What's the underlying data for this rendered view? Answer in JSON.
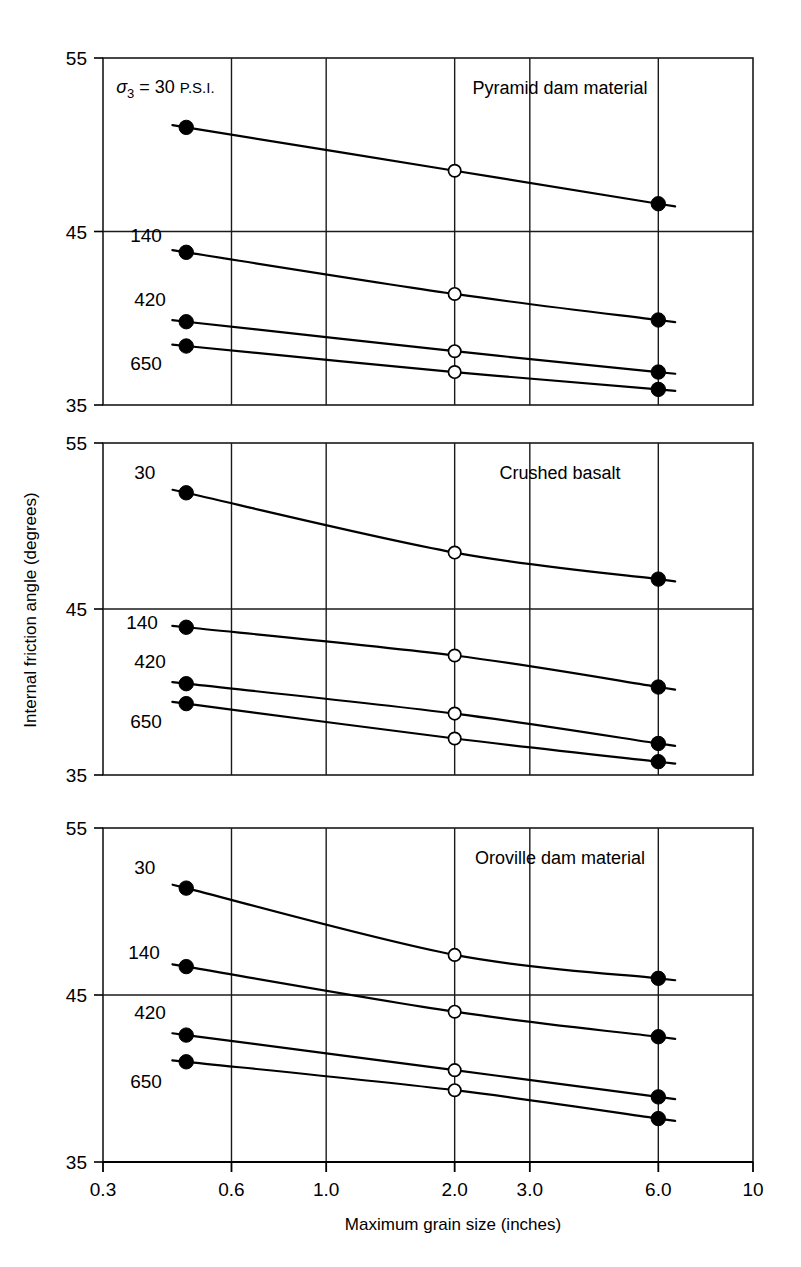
{
  "figure": {
    "width": 801,
    "height": 1267,
    "background": "#ffffff",
    "line_color": "#000000",
    "grid_color": "#1a1a1a"
  },
  "axes": {
    "x": {
      "label": "Maximum grain size (inches)",
      "scale": "log",
      "min": 0.3,
      "max": 10,
      "ticks": [
        0.3,
        0.6,
        1.0,
        2.0,
        3.0,
        6.0,
        10
      ],
      "tick_labels": [
        "0.3",
        "0.6",
        "1.0",
        "2.0",
        "3.0",
        "6.0",
        "10"
      ],
      "gridlines": [
        0.6,
        1.0,
        2.0,
        3.0,
        6.0
      ]
    },
    "y": {
      "label": "Internal friction angle (degrees)",
      "scale": "linear",
      "min": 35,
      "max": 55,
      "ticks": [
        35,
        45,
        55
      ],
      "tick_labels": [
        "35",
        "45",
        "55"
      ],
      "gridlines": [
        45
      ]
    }
  },
  "legend_note": {
    "symbol": "σ",
    "subscript": "3",
    "equals": " = ",
    "value": "30",
    "unit": "P.S.I.",
    "full_text": "σ3 = 30 P.S.I."
  },
  "markers": {
    "filled_circle": "filled-circle-marker",
    "open_circle": "open-circle-marker"
  },
  "chart_data": {
    "type": "line",
    "xlabel": "Maximum grain size (inches)",
    "ylabel": "Internal friction angle (degrees)",
    "xscale": "log",
    "xlim": [
      0.3,
      10
    ],
    "ylim": [
      35,
      55
    ],
    "grid": true,
    "legend_position": "inline-curve-labels",
    "panels": [
      {
        "id": "pyramid-dam-material",
        "title": "Pyramid dam material",
        "series": [
          {
            "name": "30",
            "confining_pressure_psi": 30,
            "label_text": "σ3 = 30 P.S.I.",
            "x": [
              0.47,
              2.0,
              6.0
            ],
            "y": [
              51.0,
              48.5,
              46.6
            ],
            "marker_types": [
              "filled",
              "open",
              "filled"
            ]
          },
          {
            "name": "140",
            "confining_pressure_psi": 140,
            "label_text": "140",
            "x": [
              0.47,
              2.0,
              6.0
            ],
            "y": [
              43.8,
              41.4,
              39.9
            ],
            "marker_types": [
              "filled",
              "open",
              "filled"
            ]
          },
          {
            "name": "420",
            "confining_pressure_psi": 420,
            "label_text": "420",
            "x": [
              0.47,
              2.0,
              6.0
            ],
            "y": [
              39.8,
              38.1,
              36.9
            ],
            "marker_types": [
              "filled",
              "open",
              "filled"
            ]
          },
          {
            "name": "650",
            "confining_pressure_psi": 650,
            "label_text": "650",
            "x": [
              0.47,
              2.0,
              6.0
            ],
            "y": [
              38.4,
              36.9,
              35.9
            ],
            "marker_types": [
              "filled",
              "open",
              "filled"
            ]
          }
        ]
      },
      {
        "id": "crushed-basalt",
        "title": "Crushed basalt",
        "series": [
          {
            "name": "30",
            "confining_pressure_psi": 30,
            "label_text": "30",
            "x": [
              0.47,
              2.0,
              6.0
            ],
            "y": [
              52.0,
              48.4,
              46.8
            ],
            "marker_types": [
              "filled",
              "open",
              "filled"
            ]
          },
          {
            "name": "140",
            "confining_pressure_psi": 140,
            "label_text": "140",
            "x": [
              0.47,
              2.0,
              6.0
            ],
            "y": [
              43.9,
              42.2,
              40.3
            ],
            "marker_types": [
              "filled",
              "open",
              "filled"
            ]
          },
          {
            "name": "420",
            "confining_pressure_psi": 420,
            "label_text": "420",
            "x": [
              0.47,
              2.0,
              6.0
            ],
            "y": [
              40.5,
              38.7,
              36.9
            ],
            "marker_types": [
              "filled",
              "open",
              "filled"
            ]
          },
          {
            "name": "650",
            "confining_pressure_psi": 650,
            "label_text": "650",
            "x": [
              0.47,
              2.0,
              6.0
            ],
            "y": [
              39.3,
              37.2,
              35.8
            ],
            "marker_types": [
              "filled",
              "open",
              "filled"
            ]
          }
        ]
      },
      {
        "id": "oroville-dam-material",
        "title": "Oroville dam material",
        "series": [
          {
            "name": "30",
            "confining_pressure_psi": 30,
            "label_text": "30",
            "x": [
              0.47,
              2.0,
              6.0
            ],
            "y": [
              51.4,
              47.4,
              46.0
            ],
            "marker_types": [
              "filled",
              "open",
              "filled"
            ]
          },
          {
            "name": "140",
            "confining_pressure_psi": 140,
            "label_text": "140",
            "x": [
              0.47,
              2.0,
              6.0
            ],
            "y": [
              46.7,
              44.0,
              42.5
            ],
            "marker_types": [
              "filled",
              "open",
              "filled"
            ]
          },
          {
            "name": "420",
            "confining_pressure_psi": 420,
            "label_text": "420",
            "x": [
              0.47,
              2.0,
              6.0
            ],
            "y": [
              42.6,
              40.5,
              38.9
            ],
            "marker_types": [
              "filled",
              "open",
              "filled"
            ]
          },
          {
            "name": "650",
            "confining_pressure_psi": 650,
            "label_text": "650",
            "x": [
              0.47,
              2.0,
              6.0
            ],
            "y": [
              41.0,
              39.3,
              37.6
            ],
            "marker_types": [
              "filled",
              "open",
              "filled"
            ]
          }
        ]
      }
    ]
  }
}
